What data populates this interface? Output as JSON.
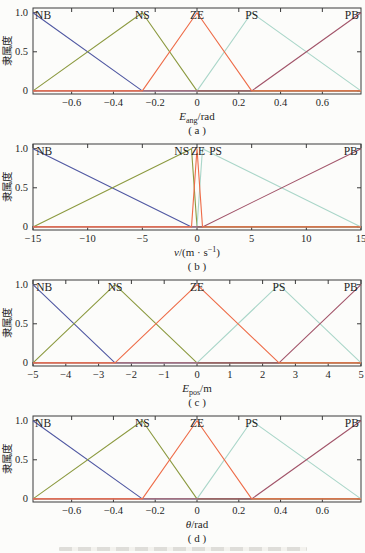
{
  "figure": {
    "y_axis_label": "隶属度",
    "membership_terms": [
      "NB",
      "NS",
      "ZE",
      "PS",
      "PB"
    ],
    "colors": {
      "NB": "#5058a2",
      "NS": "#8c9a40",
      "ZE": "#ee6c48",
      "PS": "#aad6c9",
      "PB": "#a2556a",
      "axis": "#3a3a3a",
      "text": "#1f1f1f",
      "background": "#fcfcfa"
    }
  },
  "chart_data": [
    {
      "type": "line",
      "id": "a",
      "sublabel": "( a )",
      "ylabel": "隶属度",
      "xlabel_parts": [
        {
          "t": "E",
          "s": "i"
        },
        {
          "t": "ang",
          "s": "sub"
        },
        {
          "t": "/rad",
          "s": "n"
        }
      ],
      "xlim": [
        -0.785,
        0.785
      ],
      "ylim": [
        -0.04,
        1.06
      ],
      "grid": false,
      "xticks": [
        {
          "v": -0.6,
          "l": "−0.6"
        },
        {
          "v": -0.4,
          "l": "−0.4"
        },
        {
          "v": -0.2,
          "l": "−0.2"
        },
        {
          "v": 0,
          "l": "0"
        },
        {
          "v": 0.2,
          "l": "0.2"
        },
        {
          "v": 0.4,
          "l": "0.4"
        },
        {
          "v": 0.6,
          "l": "0.6"
        }
      ],
      "yticks": [
        {
          "v": 0,
          "l": "0"
        },
        {
          "v": 0.5,
          "l": "0.5"
        },
        {
          "v": 1,
          "l": "1.0"
        }
      ],
      "series": [
        {
          "name": "NB",
          "color": "#5058a2",
          "points": [
            [
              -0.785,
              1
            ],
            [
              -0.262,
              0
            ],
            [
              0.785,
              0
            ]
          ]
        },
        {
          "name": "NS",
          "color": "#8c9a40",
          "points": [
            [
              -0.785,
              0
            ],
            [
              -0.262,
              1
            ],
            [
              0,
              0
            ],
            [
              0.785,
              0
            ]
          ]
        },
        {
          "name": "PS",
          "color": "#aad6c9",
          "points": [
            [
              -0.785,
              0
            ],
            [
              0,
              0
            ],
            [
              0.262,
              1
            ],
            [
              0.785,
              0
            ]
          ]
        },
        {
          "name": "PB",
          "color": "#a2556a",
          "points": [
            [
              -0.785,
              0
            ],
            [
              0.262,
              0
            ],
            [
              0.785,
              1
            ]
          ]
        },
        {
          "name": "ZE",
          "color": "#ee6c48",
          "points": [
            [
              -0.785,
              0
            ],
            [
              -0.262,
              0
            ],
            [
              0,
              1
            ],
            [
              0.262,
              0
            ],
            [
              0.785,
              0
            ]
          ]
        }
      ],
      "series_labels": [
        {
          "text": "NB",
          "x": -0.775,
          "anchor": "start"
        },
        {
          "text": "NS",
          "x": -0.262,
          "anchor": "middle"
        },
        {
          "text": "ZE",
          "x": 0,
          "anchor": "middle"
        },
        {
          "text": "PS",
          "x": 0.262,
          "anchor": "middle"
        },
        {
          "text": "PB",
          "x": 0.775,
          "anchor": "end"
        }
      ]
    },
    {
      "type": "line",
      "id": "b",
      "sublabel": "( b )",
      "ylabel": "隶属度",
      "xlabel_parts": [
        {
          "t": "v",
          "s": "i"
        },
        {
          "t": "/(m · s",
          "s": "n"
        },
        {
          "t": "−1",
          "s": "sup"
        },
        {
          "t": ")",
          "s": "n"
        }
      ],
      "xlim": [
        -15,
        15
      ],
      "ylim": [
        -0.04,
        1.06
      ],
      "grid": false,
      "xticks": [
        {
          "v": -15,
          "l": "−15"
        },
        {
          "v": -10,
          "l": "−10"
        },
        {
          "v": -5,
          "l": "−5"
        },
        {
          "v": 0,
          "l": "0"
        },
        {
          "v": 5,
          "l": "5"
        },
        {
          "v": 10,
          "l": "10"
        },
        {
          "v": 15,
          "l": "15"
        }
      ],
      "yticks": [
        {
          "v": 0,
          "l": "0"
        },
        {
          "v": 0.5,
          "l": "0.5"
        },
        {
          "v": 1,
          "l": "1.0"
        }
      ],
      "series": [
        {
          "name": "NB",
          "color": "#5058a2",
          "points": [
            [
              -15,
              1
            ],
            [
              -0.5,
              0
            ],
            [
              15,
              0
            ]
          ]
        },
        {
          "name": "NS",
          "color": "#8c9a40",
          "points": [
            [
              -15,
              0
            ],
            [
              -0.5,
              1
            ],
            [
              0,
              0
            ],
            [
              15,
              0
            ]
          ]
        },
        {
          "name": "PS",
          "color": "#aad6c9",
          "points": [
            [
              -15,
              0
            ],
            [
              0,
              0
            ],
            [
              0.5,
              1
            ],
            [
              15,
              0
            ]
          ]
        },
        {
          "name": "PB",
          "color": "#a2556a",
          "points": [
            [
              -15,
              0
            ],
            [
              0.5,
              0
            ],
            [
              15,
              1
            ]
          ]
        },
        {
          "name": "ZE",
          "color": "#ee6c48",
          "points": [
            [
              -15,
              0
            ],
            [
              -0.5,
              0
            ],
            [
              0,
              1
            ],
            [
              0.5,
              0
            ],
            [
              15,
              0
            ]
          ]
        }
      ],
      "series_labels": [
        {
          "text": "NB",
          "x": -14.7,
          "anchor": "start"
        },
        {
          "text": "NS",
          "x": -1.4,
          "anchor": "middle"
        },
        {
          "text": "ZE",
          "x": 0.1,
          "anchor": "middle"
        },
        {
          "text": "PS",
          "x": 1.7,
          "anchor": "middle"
        },
        {
          "text": "PB",
          "x": 14.7,
          "anchor": "end"
        }
      ]
    },
    {
      "type": "line",
      "id": "c",
      "sublabel": "( c )",
      "ylabel": "隶属度",
      "xlabel_parts": [
        {
          "t": "E",
          "s": "i"
        },
        {
          "t": "pos",
          "s": "sub"
        },
        {
          "t": "/m",
          "s": "n"
        }
      ],
      "xlim": [
        -5,
        5
      ],
      "ylim": [
        -0.04,
        1.06
      ],
      "grid": false,
      "xticks": [
        {
          "v": -5,
          "l": "−5"
        },
        {
          "v": -4,
          "l": "−4"
        },
        {
          "v": -3,
          "l": "−3"
        },
        {
          "v": -2,
          "l": "−2"
        },
        {
          "v": -1,
          "l": "−1"
        },
        {
          "v": 0,
          "l": "0"
        },
        {
          "v": 1,
          "l": "1"
        },
        {
          "v": 2,
          "l": "2"
        },
        {
          "v": 3,
          "l": "3"
        },
        {
          "v": 4,
          "l": "4"
        },
        {
          "v": 5,
          "l": "5"
        }
      ],
      "yticks": [
        {
          "v": 0,
          "l": "0"
        },
        {
          "v": 0.5,
          "l": "0.5"
        },
        {
          "v": 1,
          "l": "1.0"
        }
      ],
      "series": [
        {
          "name": "NB",
          "color": "#5058a2",
          "points": [
            [
              -5,
              1
            ],
            [
              -2.5,
              0
            ],
            [
              5,
              0
            ]
          ]
        },
        {
          "name": "NS",
          "color": "#8c9a40",
          "points": [
            [
              -5,
              0
            ],
            [
              -2.5,
              1
            ],
            [
              0,
              0
            ],
            [
              5,
              0
            ]
          ]
        },
        {
          "name": "PS",
          "color": "#aad6c9",
          "points": [
            [
              -5,
              0
            ],
            [
              0,
              0
            ],
            [
              2.5,
              1
            ],
            [
              5,
              0
            ]
          ]
        },
        {
          "name": "PB",
          "color": "#a2556a",
          "points": [
            [
              -5,
              0
            ],
            [
              2.5,
              0
            ],
            [
              5,
              1
            ]
          ]
        },
        {
          "name": "ZE",
          "color": "#ee6c48",
          "points": [
            [
              -5,
              0
            ],
            [
              -2.5,
              0
            ],
            [
              0,
              1
            ],
            [
              2.5,
              0
            ],
            [
              5,
              0
            ]
          ]
        }
      ],
      "series_labels": [
        {
          "text": "NB",
          "x": -4.9,
          "anchor": "start"
        },
        {
          "text": "NS",
          "x": -2.5,
          "anchor": "middle"
        },
        {
          "text": "ZE",
          "x": 0,
          "anchor": "middle"
        },
        {
          "text": "PS",
          "x": 2.5,
          "anchor": "middle"
        },
        {
          "text": "PB",
          "x": 4.9,
          "anchor": "end"
        }
      ]
    },
    {
      "type": "line",
      "id": "d",
      "sublabel": "( d )",
      "ylabel": "隶属度",
      "xlabel_parts": [
        {
          "t": "θ",
          "s": "i"
        },
        {
          "t": "/rad",
          "s": "n"
        }
      ],
      "xlim": [
        -0.785,
        0.785
      ],
      "ylim": [
        -0.04,
        1.06
      ],
      "grid": false,
      "xticks": [
        {
          "v": -0.6,
          "l": "−0.6"
        },
        {
          "v": -0.4,
          "l": "−0.4"
        },
        {
          "v": -0.2,
          "l": "−0.2"
        },
        {
          "v": 0,
          "l": "0"
        },
        {
          "v": 0.2,
          "l": "0.2"
        },
        {
          "v": 0.4,
          "l": "0.4"
        },
        {
          "v": 0.6,
          "l": "0.6"
        }
      ],
      "yticks": [
        {
          "v": 0,
          "l": "0"
        },
        {
          "v": 0.5,
          "l": "0.5"
        },
        {
          "v": 1,
          "l": "1.0"
        }
      ],
      "series": [
        {
          "name": "NB",
          "color": "#5058a2",
          "points": [
            [
              -0.785,
              1
            ],
            [
              -0.262,
              0
            ],
            [
              0.785,
              0
            ]
          ]
        },
        {
          "name": "NS",
          "color": "#8c9a40",
          "points": [
            [
              -0.785,
              0
            ],
            [
              -0.262,
              1
            ],
            [
              0,
              0
            ],
            [
              0.785,
              0
            ]
          ]
        },
        {
          "name": "PS",
          "color": "#aad6c9",
          "points": [
            [
              -0.785,
              0
            ],
            [
              0,
              0
            ],
            [
              0.262,
              1
            ],
            [
              0.785,
              0
            ]
          ]
        },
        {
          "name": "PB",
          "color": "#a2556a",
          "points": [
            [
              -0.785,
              0
            ],
            [
              0.262,
              0
            ],
            [
              0.785,
              1
            ]
          ]
        },
        {
          "name": "ZE",
          "color": "#ee6c48",
          "points": [
            [
              -0.785,
              0
            ],
            [
              -0.262,
              0
            ],
            [
              0,
              1
            ],
            [
              0.262,
              0
            ],
            [
              0.785,
              0
            ]
          ]
        }
      ],
      "series_labels": [
        {
          "text": "NB",
          "x": -0.775,
          "anchor": "start"
        },
        {
          "text": "NS",
          "x": -0.262,
          "anchor": "middle"
        },
        {
          "text": "ZE",
          "x": 0,
          "anchor": "middle"
        },
        {
          "text": "PS",
          "x": 0.262,
          "anchor": "middle"
        },
        {
          "text": "PB",
          "x": 0.775,
          "anchor": "end"
        }
      ]
    }
  ]
}
